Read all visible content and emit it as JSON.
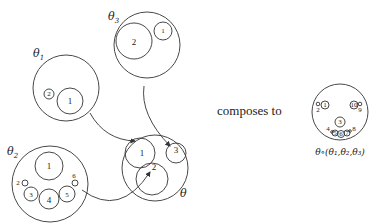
{
  "diagram": {
    "operads": [
      {
        "label": "θ",
        "sub": "1",
        "slots": [
          "1",
          "2"
        ]
      },
      {
        "label": "θ",
        "sub": "2",
        "slots": [
          "1",
          "2",
          "3",
          "4",
          "5",
          "6"
        ]
      },
      {
        "label": "θ",
        "sub": "3",
        "slots": [
          "1",
          "2"
        ]
      },
      {
        "label": "θ",
        "sub": "",
        "slots": [
          "1",
          "2",
          "3"
        ]
      }
    ],
    "caption": "composes to",
    "result": {
      "label": "θ∘(θ",
      "formula": "θ∘(θ₁,θ₂,θ₃)",
      "slots": [
        "1",
        "2",
        "3",
        "4",
        "5",
        "6",
        "7",
        "8",
        "9",
        "10"
      ]
    },
    "theta1": {
      "name": "θ",
      "sub": "1",
      "s1": "1",
      "s2": "2"
    },
    "theta2": {
      "name": "θ",
      "sub": "2",
      "s1": "1",
      "s2": "2",
      "s3": "3",
      "s4": "4",
      "s5": "5",
      "s6": "6"
    },
    "theta3": {
      "name": "θ",
      "sub": "3",
      "s1": "1",
      "s2": "2"
    },
    "theta": {
      "name": "θ",
      "s1": "1",
      "s2": "2",
      "s3": "3"
    },
    "composed": {
      "s1": "1",
      "s2": "2",
      "s3": "3",
      "s4": "4",
      "s5": "5",
      "s6": "6",
      "s7": "7",
      "s8": "8",
      "s9": "9",
      "s10": "10",
      "label": "θ∘(θ₁,θ₂,θ₃)"
    }
  }
}
